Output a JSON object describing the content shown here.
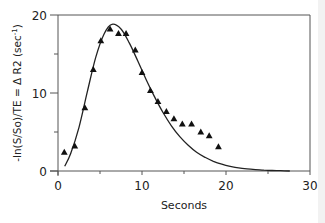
{
  "chart_data": {
    "type": "line",
    "title": "",
    "xlabel": "Seconds",
    "ylabel": "-ln(S/So)/TE = Δ R2 (sec⁻¹)",
    "ylabel_parts": {
      "main": "-ln(S/So)/TE = Δ R2 (sec",
      "sup": "-1",
      "close": ")"
    },
    "xlim": [
      0,
      30
    ],
    "ylim": [
      0,
      20
    ],
    "x_ticks": [
      0,
      10,
      20,
      30
    ],
    "x_tick_labels": [
      "0",
      "10",
      "20",
      "30"
    ],
    "x_minor_ticks": [
      5,
      15,
      25
    ],
    "y_ticks": [
      0,
      10,
      20
    ],
    "y_tick_labels": [
      "0",
      "10",
      "20"
    ],
    "y_minor_ticks": [
      5,
      15
    ],
    "grid": false,
    "legend": null,
    "series": [
      {
        "name": "measured",
        "style": "scatter",
        "marker": "triangle",
        "color": "#111111",
        "x": [
          0.75,
          2.0,
          3.2,
          4.2,
          5.1,
          6.2,
          7.2,
          8.1,
          9.2,
          10.0,
          11.0,
          11.9,
          12.9,
          13.8,
          14.8,
          15.9,
          17.0,
          18.0,
          19.1
        ],
        "y": [
          2.4,
          3.2,
          8.1,
          13.0,
          16.7,
          18.2,
          17.6,
          17.6,
          15.5,
          12.6,
          10.3,
          8.9,
          7.6,
          6.7,
          6.0,
          6.0,
          5.0,
          4.5,
          3.1
        ]
      },
      {
        "name": "fit",
        "style": "line",
        "color": "#222222",
        "x": [
          0.8,
          1.5,
          2.5,
          3.5,
          4.5,
          5.5,
          6.4,
          7.5,
          8.5,
          9.5,
          10.5,
          11.5,
          12.5,
          13.5,
          14.5,
          15.5,
          16.5,
          17.5,
          18.5,
          19.5,
          20.5,
          21.5,
          22.5,
          23.5,
          24.5,
          25.5,
          26.5,
          27.6
        ],
        "y": [
          0.6,
          2.2,
          5.6,
          10.2,
          14.6,
          17.6,
          18.8,
          18.2,
          16.4,
          14.1,
          11.7,
          9.5,
          7.5,
          5.8,
          4.4,
          3.3,
          2.4,
          1.75,
          1.25,
          0.88,
          0.6,
          0.4,
          0.27,
          0.18,
          0.12,
          0.07,
          0.04,
          0.0
        ]
      }
    ]
  },
  "colors": {
    "axis": "#555555",
    "marker": "#111111",
    "curve": "#222222",
    "background": "#ffffff",
    "side_strip": "#f2f2f2"
  }
}
